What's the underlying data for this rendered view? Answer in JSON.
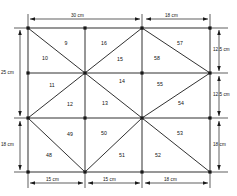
{
  "figure": {
    "type": "finite-element-mesh"
  },
  "dimensions": {
    "top": [
      {
        "id": "top-left-span",
        "label": "30 cm",
        "value": 30,
        "unit": "cm"
      },
      {
        "id": "top-right-span",
        "label": "18 cm",
        "value": 18,
        "unit": "cm"
      }
    ],
    "bottom": [
      {
        "id": "bottom-span-1",
        "label": "15 cm",
        "value": 15,
        "unit": "cm"
      },
      {
        "id": "bottom-span-2",
        "label": "15 cm",
        "value": 15,
        "unit": "cm"
      },
      {
        "id": "bottom-span-3",
        "label": "18 cm",
        "value": 18,
        "unit": "cm"
      }
    ],
    "left": [
      {
        "id": "left-span-upper",
        "label": "25 cm",
        "value": 25,
        "unit": "cm"
      },
      {
        "id": "left-span-lower",
        "label": "18 cm",
        "value": 18,
        "unit": "cm"
      }
    ],
    "right": [
      {
        "id": "right-span-1",
        "label": "12.5 cm",
        "value": 12.5,
        "unit": "cm"
      },
      {
        "id": "right-span-2",
        "label": "12.5 cm",
        "value": 12.5,
        "unit": "cm"
      },
      {
        "id": "right-span-3",
        "label": "18 cm",
        "value": 18,
        "unit": "cm"
      }
    ]
  },
  "elements": [
    {
      "id": "element-9",
      "label": "9",
      "x": 66,
      "y": 43
    },
    {
      "id": "element-10",
      "label": "10",
      "x": 45,
      "y": 58
    },
    {
      "id": "element-16",
      "label": "16",
      "x": 104,
      "y": 43
    },
    {
      "id": "element-15",
      "label": "15",
      "x": 120,
      "y": 59
    },
    {
      "id": "element-58",
      "label": "58",
      "x": 157,
      "y": 58
    },
    {
      "id": "element-57",
      "label": "57",
      "x": 180,
      "y": 43
    },
    {
      "id": "element-11",
      "label": "11",
      "x": 52,
      "y": 85
    },
    {
      "id": "element-14",
      "label": "14",
      "x": 122,
      "y": 81
    },
    {
      "id": "element-55",
      "label": "55",
      "x": 160,
      "y": 84
    },
    {
      "id": "element-12",
      "label": "12",
      "x": 70,
      "y": 104
    },
    {
      "id": "element-13",
      "label": "13",
      "x": 105,
      "y": 103
    },
    {
      "id": "element-54",
      "label": "54",
      "x": 181,
      "y": 103
    },
    {
      "id": "element-49",
      "label": "49",
      "x": 70,
      "y": 134
    },
    {
      "id": "element-50",
      "label": "50",
      "x": 104,
      "y": 133
    },
    {
      "id": "element-53",
      "label": "53",
      "x": 180,
      "y": 133
    },
    {
      "id": "element-48",
      "label": "48",
      "x": 49,
      "y": 155
    },
    {
      "id": "element-51",
      "label": "51",
      "x": 122,
      "y": 155
    },
    {
      "id": "element-52",
      "label": "52",
      "x": 158,
      "y": 155
    }
  ],
  "chart_data": {
    "type": "diagram",
    "title": "",
    "geometry": {
      "x_grid_cm": [
        0,
        15,
        30,
        48
      ],
      "y_grid_cm": [
        0,
        12.5,
        25,
        43
      ],
      "total_width_cm": 48,
      "total_height_cm": 43
    },
    "element_numbers": [
      9,
      10,
      11,
      12,
      13,
      14,
      15,
      16,
      48,
      49,
      50,
      51,
      52,
      53,
      54,
      55,
      57,
      58
    ]
  },
  "colors": {
    "line": "#1a1a1a",
    "background": "#ffffff",
    "text": "#111111"
  }
}
